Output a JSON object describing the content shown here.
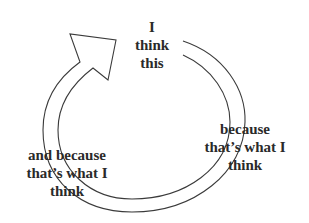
{
  "diagram": {
    "type": "circular-reasoning-cycle",
    "stroke_color": "#3a3a3a",
    "text_color": "#2a2a2a",
    "labels": {
      "top": "I\nthink\nthis",
      "right": "because\nthat’s what I\nthink",
      "left": "and because\nthat’s what I\nthink"
    },
    "arrow_direction": "clockwise"
  }
}
